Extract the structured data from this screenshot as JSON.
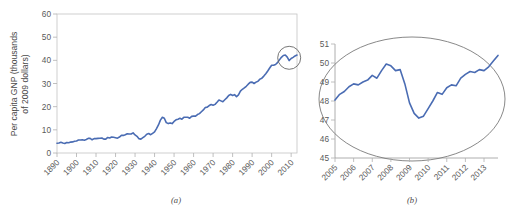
{
  "figure": {
    "background": "#ffffff",
    "line_color": "#4a6cb3",
    "axis_color": "#b0b0b0",
    "text_color": "#4a4a4a",
    "annotation_color": "#7a7a7a"
  },
  "panel_a": {
    "caption": "(a)",
    "ylabel_line1": "Per capita GNP (thousands",
    "ylabel_line2": "of 2009 dollars)",
    "y_ticks": [
      "0",
      "10",
      "20",
      "30",
      "40",
      "50",
      "60"
    ],
    "x_ticks": [
      "1890",
      "1900",
      "1910",
      "1920",
      "1930",
      "1940",
      "1950",
      "1960",
      "1970",
      "1980",
      "1990",
      "2000",
      "2010"
    ],
    "annotation": "highlight-circle-recent-years"
  },
  "panel_b": {
    "caption": "(b)",
    "y_ticks": [
      "45",
      "46",
      "47",
      "48",
      "49",
      "50",
      "51"
    ],
    "x_ticks": [
      "2005",
      "2006",
      "2007",
      "2008",
      "2009",
      "2010",
      "2011",
      "2012",
      "2013"
    ],
    "annotation": "magnifier-ellipse"
  },
  "chart_data": [
    {
      "type": "line",
      "id": "panel-a",
      "title": "",
      "xlabel": "",
      "ylabel": "Per capita GNP (thousands of 2009 dollars)",
      "xlim": [
        1890,
        2013
      ],
      "ylim": [
        0,
        60
      ],
      "grid": false,
      "legend": "none",
      "x": [
        1890,
        1891,
        1892,
        1893,
        1894,
        1895,
        1896,
        1897,
        1898,
        1899,
        1900,
        1901,
        1902,
        1903,
        1904,
        1905,
        1906,
        1907,
        1908,
        1909,
        1910,
        1911,
        1912,
        1913,
        1914,
        1915,
        1916,
        1917,
        1918,
        1919,
        1920,
        1921,
        1922,
        1923,
        1924,
        1925,
        1926,
        1927,
        1928,
        1929,
        1930,
        1931,
        1932,
        1933,
        1934,
        1935,
        1936,
        1937,
        1938,
        1939,
        1940,
        1941,
        1942,
        1943,
        1944,
        1945,
        1946,
        1947,
        1948,
        1949,
        1950,
        1951,
        1952,
        1953,
        1954,
        1955,
        1956,
        1957,
        1958,
        1959,
        1960,
        1961,
        1962,
        1963,
        1964,
        1965,
        1966,
        1967,
        1968,
        1969,
        1970,
        1971,
        1972,
        1973,
        1974,
        1975,
        1976,
        1977,
        1978,
        1979,
        1980,
        1981,
        1982,
        1983,
        1984,
        1985,
        1986,
        1987,
        1988,
        1989,
        1990,
        1991,
        1992,
        1993,
        1994,
        1995,
        1996,
        1997,
        1998,
        1999,
        2000,
        2001,
        2002,
        2003,
        2004,
        2005,
        2006,
        2007,
        2008,
        2009,
        2010,
        2011,
        2012,
        2013
      ],
      "values": [
        4.2,
        4.3,
        4.6,
        4.3,
        4.1,
        4.5,
        4.4,
        4.7,
        4.8,
        5.1,
        5.2,
        5.6,
        5.6,
        5.7,
        5.5,
        5.8,
        6.3,
        6.3,
        5.7,
        6.2,
        6.2,
        6.3,
        6.4,
        6.5,
        6.0,
        6.0,
        6.7,
        6.5,
        6.9,
        6.8,
        6.6,
        6.4,
        6.9,
        7.6,
        7.6,
        7.9,
        8.3,
        8.2,
        8.2,
        8.7,
        7.8,
        7.2,
        6.2,
        6.0,
        6.6,
        7.2,
        8.1,
        8.4,
        7.9,
        8.5,
        9.1,
        10.5,
        12.1,
        14.2,
        15.4,
        15.0,
        13.1,
        12.7,
        13.0,
        12.7,
        13.6,
        14.3,
        14.6,
        15.0,
        14.6,
        15.4,
        15.4,
        15.4,
        15.0,
        15.8,
        15.9,
        15.9,
        16.6,
        17.0,
        17.8,
        18.6,
        19.6,
        19.8,
        20.5,
        20.9,
        20.6,
        21.0,
        21.9,
        22.9,
        22.5,
        22.1,
        23.0,
        23.8,
        24.8,
        25.3,
        24.8,
        25.2,
        24.3,
        25.1,
        26.7,
        27.5,
        28.1,
        28.8,
        29.7,
        30.5,
        30.6,
        30.0,
        30.6,
        31.0,
        31.9,
        32.3,
        33.2,
        34.2,
        35.4,
        36.7,
        37.9,
        37.9,
        38.2,
        39.0,
        40.2,
        41.3,
        42.1,
        42.3,
        41.4,
        39.9,
        40.8,
        41.3,
        41.9,
        42.3
      ]
    },
    {
      "type": "line",
      "id": "panel-b",
      "title": "",
      "xlabel": "",
      "ylabel": "",
      "xlim": [
        2005.0,
        2013.75
      ],
      "ylim": [
        45,
        51
      ],
      "grid": false,
      "legend": "none",
      "note": "Quarterly detail of the circled region in panel (a); values in thousands of 2009 dollars",
      "x": [
        2005.0,
        2005.25,
        2005.5,
        2005.75,
        2006.0,
        2006.25,
        2006.5,
        2006.75,
        2007.0,
        2007.25,
        2007.5,
        2007.75,
        2008.0,
        2008.25,
        2008.5,
        2008.75,
        2009.0,
        2009.25,
        2009.5,
        2009.75,
        2010.0,
        2010.25,
        2010.5,
        2010.75,
        2011.0,
        2011.25,
        2011.5,
        2011.75,
        2012.0,
        2012.25,
        2012.5,
        2012.75,
        2013.0,
        2013.25,
        2013.5,
        2013.75
      ],
      "values": [
        48.05,
        48.35,
        48.5,
        48.75,
        48.9,
        48.85,
        49.0,
        49.1,
        49.35,
        49.2,
        49.6,
        49.95,
        49.85,
        49.6,
        49.65,
        48.9,
        47.9,
        47.35,
        47.1,
        47.2,
        47.6,
        48.0,
        48.45,
        48.35,
        48.7,
        48.85,
        48.8,
        49.2,
        49.4,
        49.55,
        49.5,
        49.65,
        49.6,
        49.8,
        50.1,
        50.4
      ]
    }
  ]
}
